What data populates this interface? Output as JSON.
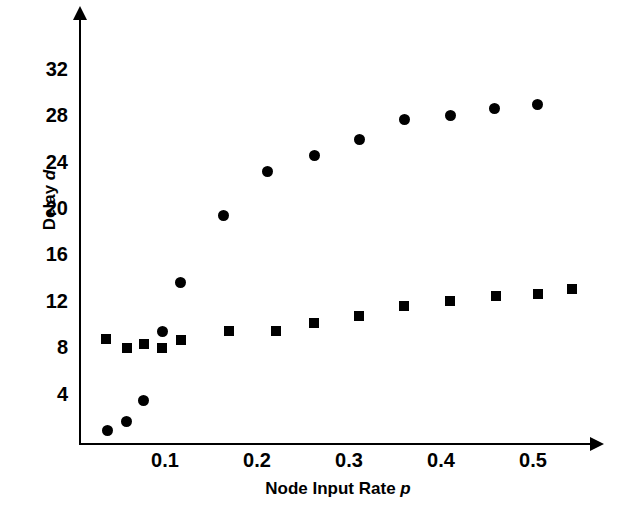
{
  "chart_data": {
    "type": "scatter",
    "title": "",
    "xlabel": "Node Input Rate p",
    "xlabel_main": "Node Input Rate",
    "xlabel_symbol": "p",
    "ylabel": "Delay d",
    "ylabel_main": "Delay",
    "ylabel_symbol": "d",
    "xlim": [
      0,
      0.56
    ],
    "ylim": [
      0,
      35
    ],
    "xticks": [
      0.1,
      0.2,
      0.3,
      0.4,
      0.5
    ],
    "xtick_labels": [
      "0.1",
      "0.2",
      "0.3",
      "0.4",
      "0.5"
    ],
    "yticks": [
      4,
      8,
      12,
      16,
      20,
      24,
      28,
      32
    ],
    "ytick_labels": [
      "4",
      "8",
      "12",
      "16",
      "20",
      "24",
      "28",
      "32"
    ],
    "grid": false,
    "legend": "none",
    "marker_color": "#000000",
    "series": [
      {
        "name": "circles",
        "marker": "circle",
        "points": [
          {
            "x": 0.038,
            "y": 0.9
          },
          {
            "x": 0.058,
            "y": 1.7
          },
          {
            "x": 0.077,
            "y": 3.5
          },
          {
            "x": 0.097,
            "y": 9.4
          },
          {
            "x": 0.117,
            "y": 13.7
          },
          {
            "x": 0.164,
            "y": 19.4
          },
          {
            "x": 0.211,
            "y": 23.2
          },
          {
            "x": 0.262,
            "y": 24.6
          },
          {
            "x": 0.311,
            "y": 26.0
          },
          {
            "x": 0.36,
            "y": 27.7
          },
          {
            "x": 0.41,
            "y": 28.1
          },
          {
            "x": 0.458,
            "y": 28.7
          },
          {
            "x": 0.505,
            "y": 29.0
          }
        ]
      },
      {
        "name": "squares",
        "marker": "square",
        "points": [
          {
            "x": 0.036,
            "y": 8.8
          },
          {
            "x": 0.059,
            "y": 8.0
          },
          {
            "x": 0.077,
            "y": 8.4
          },
          {
            "x": 0.097,
            "y": 8.0
          },
          {
            "x": 0.117,
            "y": 8.7
          },
          {
            "x": 0.17,
            "y": 9.5
          },
          {
            "x": 0.221,
            "y": 9.5
          },
          {
            "x": 0.262,
            "y": 10.2
          },
          {
            "x": 0.311,
            "y": 10.8
          },
          {
            "x": 0.36,
            "y": 11.6
          },
          {
            "x": 0.41,
            "y": 12.1
          },
          {
            "x": 0.46,
            "y": 12.5
          },
          {
            "x": 0.505,
            "y": 12.7
          },
          {
            "x": 0.542,
            "y": 13.1
          }
        ]
      }
    ]
  }
}
